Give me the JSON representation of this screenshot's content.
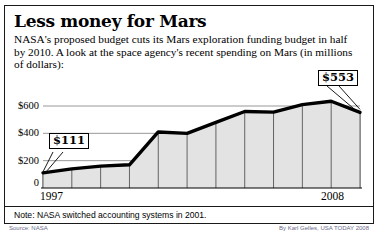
{
  "headline": "Less money for Mars",
  "subtitle": "NASA's proposed budget cuts its Mars exploration funding budget in half by 2010. A look at the space agency's recent spending on Mars (in millions of dollars):",
  "note": "Note: NASA switched accounting systems in 2001.",
  "credits": {
    "source_label": "Source: NASA",
    "byline": "By Karl Gelles, USA TODAY 2008"
  },
  "callouts": [
    {
      "name": "first-value-callout",
      "label": "$111"
    },
    {
      "name": "last-value-callout",
      "label": "$553"
    }
  ],
  "colors": {
    "line": "#000000",
    "fill": "#e3e3e3",
    "grid": "#8c8c8c",
    "border": "#1a1a1a",
    "text": "#000000"
  },
  "chart_data": {
    "type": "area",
    "title": "Less money for Mars",
    "subtitle": "NASA's proposed budget cuts its Mars exploration funding budget in half by 2010. A look at the space agency's recent spending on Mars (in millions of dollars):",
    "xlabel": "",
    "ylabel": "millions of dollars",
    "ylim": [
      0,
      700
    ],
    "yticks": [
      0,
      200,
      400,
      600
    ],
    "ytick_labels": [
      "0",
      "$200",
      "$400",
      "$600"
    ],
    "grid": "horizontal-and-vertical",
    "legend": "none",
    "categories": [
      1997,
      1998,
      1999,
      2000,
      2001,
      2002,
      2003,
      2004,
      2005,
      2006,
      2007,
      2008
    ],
    "xtick_labels": [
      "1997",
      "",
      "",
      "",
      "",
      "",
      "",
      "",
      "",
      "",
      "",
      "2008"
    ],
    "values": [
      111,
      140,
      160,
      170,
      410,
      400,
      480,
      560,
      555,
      610,
      635,
      553
    ],
    "annotations": [
      {
        "x": 1997,
        "y": 111,
        "label": "$111"
      },
      {
        "x": 2008,
        "y": 553,
        "label": "$553"
      }
    ],
    "note": "Note: NASA switched accounting systems in 2001."
  }
}
